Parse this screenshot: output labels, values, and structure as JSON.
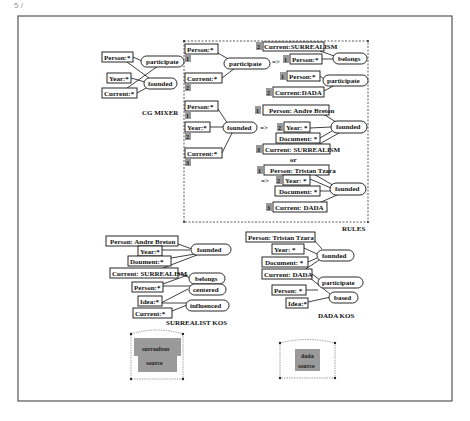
{
  "page_marker": "5 /",
  "sections": {
    "cg_mixer": {
      "label": "CG MIXER"
    },
    "rules": {
      "label": "RULES"
    },
    "surrealist_kos": {
      "label": "SURREALIST KOS"
    },
    "dada_kos": {
      "label": "DADA KOS"
    }
  },
  "cg_mixer": {
    "concepts": [
      "Person:*",
      "Year:*",
      "Current:*"
    ],
    "relations": [
      "participate",
      "founded"
    ]
  },
  "rules": {
    "rule1": {
      "lhs": {
        "concepts": [
          {
            "text": "Person:*",
            "num": "1"
          },
          {
            "text": "Current:*",
            "num": "2"
          }
        ],
        "relation": "participate"
      },
      "arrow": "=>",
      "rhs": {
        "group1": {
          "concepts": [
            {
              "text": "Current:SURREALISM",
              "num": "2"
            },
            {
              "text": "Person:*",
              "num": "1"
            }
          ],
          "relation": "belongs"
        },
        "group2": {
          "concepts": [
            {
              "text": "Person:*",
              "num": "1"
            },
            {
              "text": "Current:DADA",
              "num": "2"
            }
          ],
          "relation": "participate"
        }
      }
    },
    "rule2": {
      "lhs": {
        "concepts": [
          {
            "text": "Person:*",
            "num": "1"
          },
          {
            "text": "Year:*",
            "num": "2"
          },
          {
            "text": "Current:*",
            "num": "3"
          }
        ],
        "relation": "founded"
      },
      "arrow": "=>",
      "rhs": {
        "group1": {
          "concepts": [
            {
              "text": "Person: Andre Breton",
              "num": "1"
            },
            {
              "text": "Year: *",
              "num": "2"
            },
            {
              "text": "Document: *",
              "num": ""
            },
            {
              "text": "Current: SURREALISM",
              "num": "3"
            }
          ],
          "relation": "founded"
        },
        "or_label": "or",
        "arrow2": "=>",
        "group2": {
          "concepts": [
            {
              "text": "Person: Tristan Tzara",
              "num": "1"
            },
            {
              "text": "Year: *",
              "num": "2"
            },
            {
              "text": "Document: *",
              "num": ""
            },
            {
              "text": "Current: DADA",
              "num": "3"
            }
          ],
          "relation": "founded"
        }
      }
    }
  },
  "surrealist_kos": {
    "concepts": [
      "Person: Andre Breton",
      "Year:*",
      "Doument:*",
      "Current: SURREALISM",
      "Person:*",
      "Idea:*",
      "Current:*"
    ],
    "relations": [
      "founded",
      "belongs",
      "centered",
      "influenced"
    ],
    "source": {
      "line1": "surrealism",
      "line2": "source"
    }
  },
  "dada_kos": {
    "concepts": [
      "Person: Tristan Tzara",
      "Year: *",
      "Document: *",
      "Current: DADA",
      "Person: *",
      "Idea:*"
    ],
    "relations": [
      "founded",
      "participate",
      "based"
    ],
    "source": {
      "line1": "dada",
      "line2": "source"
    }
  }
}
